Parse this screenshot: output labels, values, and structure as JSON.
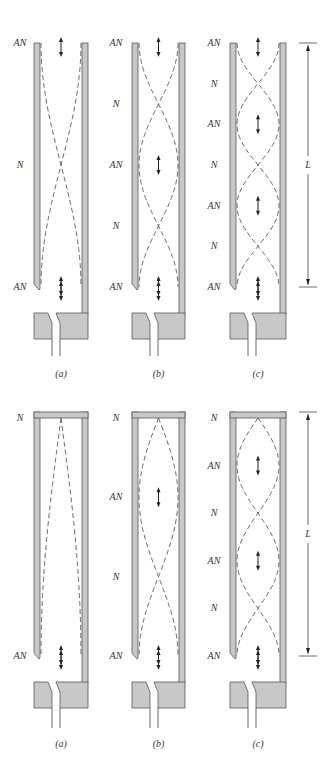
{
  "figure": {
    "top_row": {
      "pipe_type": "open",
      "panels": [
        {
          "id": "a",
          "caption": "(a)",
          "labels": [
            "AN",
            "N",
            "AN"
          ],
          "half_wavelengths": 1
        },
        {
          "id": "b",
          "caption": "(b)",
          "labels": [
            "AN",
            "N",
            "AN",
            "N",
            "AN"
          ],
          "half_wavelengths": 2
        },
        {
          "id": "c",
          "caption": "(c)",
          "labels": [
            "AN",
            "N",
            "AN",
            "N",
            "AN",
            "N",
            "AN"
          ],
          "half_wavelengths": 3,
          "length_label": "L"
        }
      ]
    },
    "bottom_row": {
      "pipe_type": "closed",
      "panels": [
        {
          "id": "a",
          "caption": "(a)",
          "labels": [
            "N",
            "AN"
          ],
          "quarter_wavelengths": 1
        },
        {
          "id": "b",
          "caption": "(b)",
          "labels": [
            "N",
            "AN",
            "N",
            "AN"
          ],
          "quarter_wavelengths": 3
        },
        {
          "id": "c",
          "caption": "(c)",
          "labels": [
            "N",
            "AN",
            "N",
            "AN",
            "N",
            "AN"
          ],
          "quarter_wavelengths": 5,
          "length_label": "L"
        }
      ]
    },
    "legend": {
      "AN": "antinode",
      "N": "node",
      "double-arrow-icon": "air displacement at antinode"
    }
  }
}
